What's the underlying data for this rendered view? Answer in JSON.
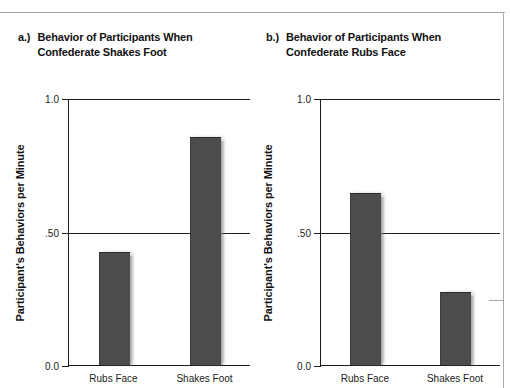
{
  "figure": {
    "panels": [
      {
        "id": "a",
        "tag": "a.)",
        "title": "Behavior of Participants When\nConfederate Shakes Foot",
        "ylabel": "Participant's Behaviors per Minute"
      },
      {
        "id": "b",
        "tag": "b.)",
        "title": "Behavior of Participants When\nConfederate Rubs Face",
        "ylabel": "Participant's Behaviors per Minute"
      }
    ]
  },
  "chart_data": [
    {
      "type": "bar",
      "title": "Behavior of Participants When Confederate Shakes Foot",
      "panel_tag": "a.)",
      "categories": [
        "Rubs Face",
        "Shakes Foot"
      ],
      "values": [
        0.42,
        0.85
      ],
      "xlabel": "",
      "ylabel": "Participant's Behaviors per Minute",
      "ylim": [
        0.0,
        1.0
      ],
      "yticks": [
        0.0,
        0.5,
        1.0
      ],
      "ytick_labels": [
        "0.0",
        ".50",
        "1.0"
      ],
      "grid": true,
      "legend": "none",
      "bar_color": "#4c4c4c",
      "axis_color": "#1c1c1c"
    },
    {
      "type": "bar",
      "title": "Behavior of Participants When Confederate Rubs Face",
      "panel_tag": "b.)",
      "categories": [
        "Rubs Face",
        "Shakes Foot"
      ],
      "values": [
        0.64,
        0.27
      ],
      "xlabel": "",
      "ylabel": "Participant's Behaviors per Minute",
      "ylim": [
        0.0,
        1.0
      ],
      "yticks": [
        0.0,
        0.5,
        1.0
      ],
      "ytick_labels": [
        "0.0",
        ".50",
        "1.0"
      ],
      "grid": true,
      "legend": "none",
      "bar_color": "#4c4c4c",
      "axis_color": "#1c1c1c"
    }
  ]
}
